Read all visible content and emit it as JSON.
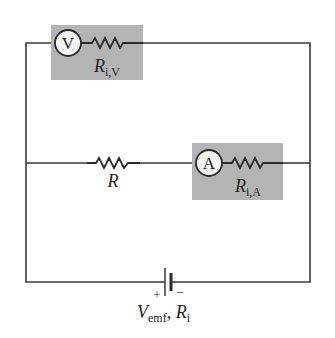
{
  "diagram": {
    "type": "circuit",
    "colors": {
      "wire": "#3a3a3a",
      "meter_box": "#b4b4b4",
      "background": "#ffffff"
    },
    "voltmeter": {
      "symbol": "V",
      "resistor_label_main": "R",
      "resistor_label_sub": "i,V"
    },
    "ammeter": {
      "symbol": "A",
      "resistor_label_main": "R",
      "resistor_label_sub": "i,A"
    },
    "load_resistor": {
      "label": "R"
    },
    "battery": {
      "plus": "+",
      "minus": "−",
      "label_v_main": "V",
      "label_v_sub": "emf",
      "label_sep": ", ",
      "label_r_main": "R",
      "label_r_sub": "i"
    }
  }
}
